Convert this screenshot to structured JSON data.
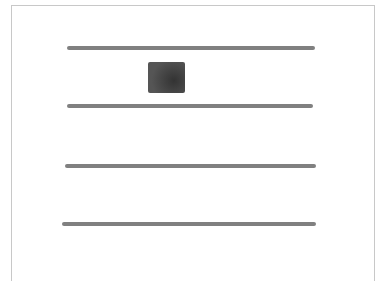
{
  "sketch": {
    "type": "wireframe",
    "colors": {
      "line": "#808080",
      "block": "#4a4a4a",
      "frame": "#c8c8c8",
      "background": "#ffffff"
    },
    "lines": [
      {
        "name": "line-1",
        "x1": 67,
        "x2": 315,
        "y": 47
      },
      {
        "name": "line-2",
        "x1": 67,
        "x2": 313,
        "y": 105
      },
      {
        "name": "line-3",
        "x1": 65,
        "x2": 316,
        "y": 165
      },
      {
        "name": "line-4",
        "x1": 62,
        "x2": 316,
        "y": 223
      }
    ],
    "block": {
      "x": 148,
      "y": 62,
      "width": 37,
      "height": 31
    }
  }
}
